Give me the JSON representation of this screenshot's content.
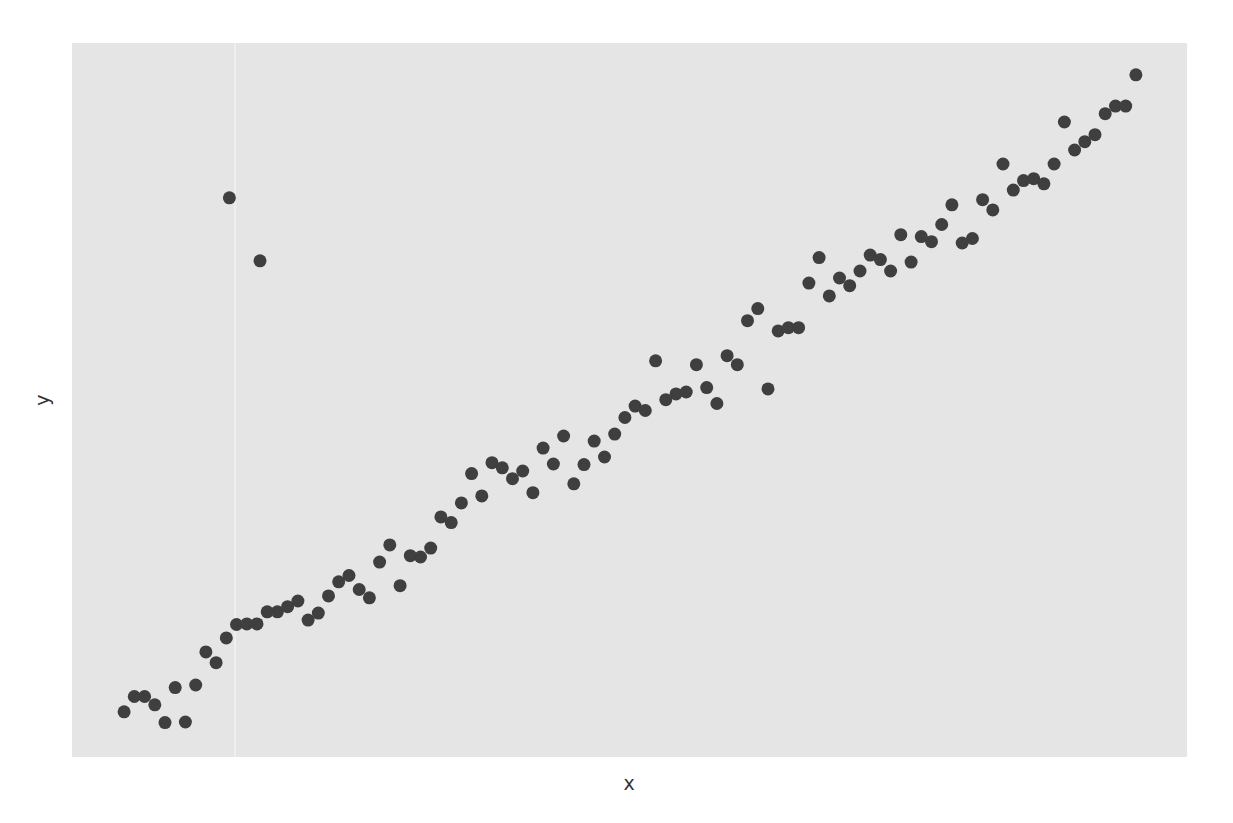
{
  "chart_data": {
    "type": "scatter",
    "title": "",
    "xlabel": "x",
    "ylabel": "y",
    "xlim": [
      -5.1,
      104.0
    ],
    "ylim": [
      -7.1,
      105.0
    ],
    "grid": false,
    "tick_labels_shown": false,
    "legend": "none",
    "colors": {
      "panel": "#e5e5e5",
      "point": "#3f3f3f",
      "text": "#333333"
    },
    "series": [
      {
        "name": "observations",
        "x": [
          0,
          1,
          2,
          3,
          4,
          5,
          6,
          7,
          8,
          9,
          10,
          11,
          12,
          13,
          14,
          15,
          16,
          17,
          18,
          19,
          20,
          21,
          22,
          23,
          24,
          25,
          26,
          27,
          28,
          29,
          30,
          31,
          32,
          33,
          34,
          35,
          36,
          37,
          38,
          39,
          40,
          41,
          42,
          43,
          44,
          45,
          46,
          47,
          48,
          49,
          50,
          51,
          52,
          53,
          54,
          55,
          56,
          57,
          58,
          59,
          60,
          61,
          62,
          63,
          64,
          65,
          66,
          67,
          68,
          69,
          70,
          71,
          72,
          73,
          74,
          75,
          76,
          77,
          78,
          79,
          80,
          81,
          82,
          83,
          84,
          85,
          86,
          87,
          88,
          89,
          90,
          91,
          92,
          93,
          94,
          95,
          96,
          97,
          98,
          99
        ],
        "y": [
          0.0,
          2.4,
          2.4,
          1.1,
          -1.7,
          3.8,
          -1.6,
          4.2,
          9.4,
          7.7,
          11.6,
          13.7,
          13.8,
          13.8,
          15.7,
          15.7,
          16.5,
          17.4,
          14.4,
          15.5,
          18.2,
          20.4,
          21.4,
          19.2,
          17.9,
          23.5,
          26.2,
          19.8,
          24.5,
          24.3,
          25.7,
          30.6,
          29.7,
          32.8,
          37.4,
          33.9,
          39.1,
          38.3,
          36.6,
          37.8,
          34.4,
          41.4,
          38.9,
          43.3,
          35.8,
          38.8,
          42.5,
          40.0,
          43.6,
          46.2,
          48.0,
          47.3,
          55.1,
          49.0,
          49.9,
          50.2,
          54.5,
          50.9,
          48.4,
          55.9,
          54.5,
          61.4,
          63.3,
          50.7,
          59.8,
          60.3,
          60.3,
          67.3,
          71.3,
          65.3,
          68.1,
          66.9,
          69.2,
          71.7,
          71.0,
          69.2,
          74.9,
          70.6,
          74.6,
          73.8,
          76.5,
          79.6,
          73.6,
          74.3,
          80.4,
          78.8,
          86.0,
          81.9,
          83.4,
          83.7,
          82.9,
          86.0,
          92.6,
          88.2,
          89.5,
          90.6,
          93.9,
          95.1,
          95.1,
          100.0
        ]
      },
      {
        "name": "outliers",
        "x": [
          10.3,
          13.3
        ],
        "y": [
          80.7,
          70.8
        ]
      }
    ]
  }
}
